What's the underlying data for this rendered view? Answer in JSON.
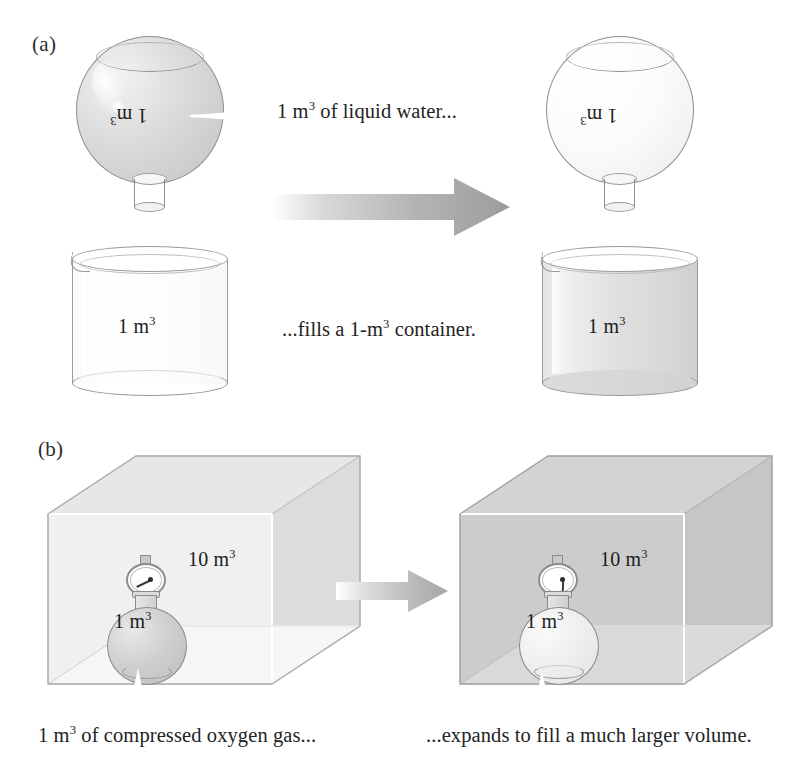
{
  "figure": {
    "title_panels": [
      "(a)",
      "(b)"
    ],
    "background_color": "#ffffff",
    "ink_color": "#232323",
    "accent_gray": "#a8a8a8"
  },
  "panel_a": {
    "label": "(a)",
    "left": {
      "flask": {
        "label_text": "1 m",
        "label_exponent": "3",
        "state": "filled",
        "contents": "liquid water",
        "rotated_label": true
      },
      "beaker": {
        "label_text": "1 m",
        "label_exponent": "3",
        "state": "empty"
      }
    },
    "right": {
      "flask": {
        "label_text": "1 m",
        "label_exponent": "3",
        "state": "empty",
        "rotated_label": true
      },
      "beaker": {
        "label_text": "1 m",
        "label_exponent": "3",
        "state": "filled"
      }
    },
    "caption_top": {
      "prefix": "1 m",
      "exponent": "3",
      "suffix": " of liquid water..."
    },
    "caption_bottom": {
      "prefix": "...fills a 1-m",
      "exponent": "3",
      "suffix": " container."
    },
    "arrow": {
      "name": "transition-arrow",
      "direction": "right",
      "gradient_from": "#ffffff",
      "gradient_to": "#9e9e9e"
    }
  },
  "panel_b": {
    "label": "(b)",
    "left": {
      "cube": {
        "label_text": "10 m",
        "label_exponent": "3",
        "state": "empty"
      },
      "gas_flask": {
        "label_text": "1 m",
        "label_exponent": "3",
        "state": "filled",
        "gauge": "pressure-gauge"
      }
    },
    "right": {
      "cube": {
        "label_text": "10 m",
        "label_exponent": "3",
        "state": "filled"
      },
      "gas_flask": {
        "label_text": "1 m",
        "label_exponent": "3",
        "state": "empty",
        "gauge": "pressure-gauge"
      }
    },
    "caption_left": {
      "prefix": "1 m",
      "exponent": "3",
      "suffix": " of compressed oxygen gas..."
    },
    "caption_right": {
      "prefix": "",
      "exponent": "",
      "suffix": "...expands to fill a much larger volume."
    },
    "arrow": {
      "name": "transition-arrow",
      "direction": "right",
      "gradient_from": "#ffffff",
      "gradient_to": "#a5a5a5"
    }
  }
}
